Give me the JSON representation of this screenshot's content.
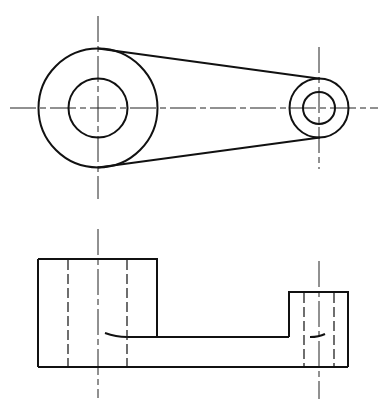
{
  "drawing": {
    "type": "orthographic-engineering-drawing",
    "colors": {
      "line": "#111111",
      "background": "#ffffff"
    },
    "top_view": {
      "large_boss": {
        "cx": 98,
        "cy": 108,
        "outer_r": 59.5,
        "inner_r": 29.5
      },
      "small_boss": {
        "cx": 319,
        "cy": 108,
        "outer_r": 29.5,
        "inner_r": 16
      },
      "tangent_lines": [
        {
          "x1": 98,
          "y1": 48,
          "x2": 319,
          "y2": 79
        },
        {
          "x1": 98,
          "y1": 168,
          "x2": 319,
          "y2": 138
        }
      ],
      "centerlines": {
        "horizontal": {
          "x1": 10,
          "x2": 378,
          "y": 108
        },
        "left_vertical": {
          "x": 98,
          "y1": 16,
          "y2": 199
        },
        "right_vertical": {
          "x": 319,
          "y1": 47,
          "y2": 169
        }
      }
    },
    "front_view": {
      "left_block": {
        "x": 38,
        "y": 259,
        "w": 119,
        "h": 108,
        "hidden_x": [
          68,
          127
        ]
      },
      "right_block": {
        "x": 289,
        "y": 292,
        "w": 59,
        "h": 75,
        "hidden_x": [
          304,
          334
        ]
      },
      "arm": {
        "top_y": 337,
        "bottom_y": 367,
        "x1": 157,
        "x2": 289
      },
      "centerlines": [
        {
          "x": 98,
          "y1": 229,
          "y2": 398
        },
        {
          "x": 319,
          "y1": 261,
          "y2": 399
        }
      ]
    }
  }
}
